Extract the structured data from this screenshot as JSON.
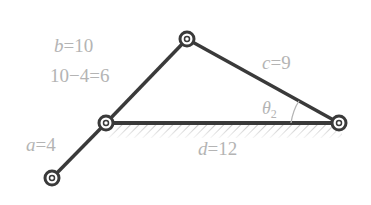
{
  "diagram": {
    "colors": {
      "link": "#3a3a3a",
      "label": "#b4b4b4",
      "hatch": "#9a9a9a",
      "background": "#ffffff"
    },
    "joints": [
      {
        "id": "top",
        "x": 187,
        "y": 39
      },
      {
        "id": "left",
        "x": 106,
        "y": 123
      },
      {
        "id": "right",
        "x": 339,
        "y": 123
      },
      {
        "id": "bottom",
        "x": 52,
        "y": 178
      }
    ],
    "links": [
      {
        "id": "a",
        "from": "bottom",
        "to": "left"
      },
      {
        "id": "b",
        "from": "left",
        "to": "top"
      },
      {
        "id": "c",
        "from": "top",
        "to": "right"
      },
      {
        "id": "d",
        "from": "left",
        "to": "right",
        "ground": true
      }
    ],
    "labels": {
      "b": {
        "var": "b",
        "eq": "=10"
      },
      "diff": "10−4=6",
      "c": {
        "var": "c",
        "eq": "=9"
      },
      "a": {
        "var": "a",
        "eq": "=4"
      },
      "d": {
        "var": "d",
        "eq": "=12"
      },
      "theta": {
        "symbol": "θ",
        "sub": "2"
      }
    }
  }
}
